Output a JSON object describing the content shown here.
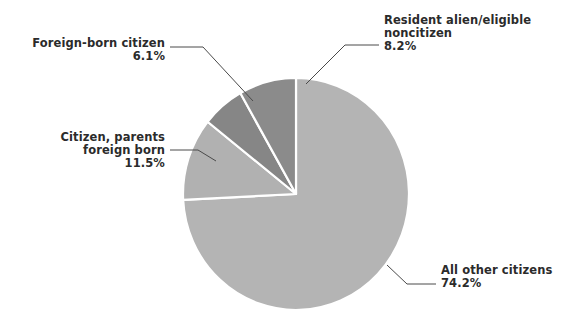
{
  "chart_data": {
    "type": "pie",
    "title": "",
    "categories": [
      "All other citizens",
      "Citizen, parents foreign born",
      "Foreign-born citizen",
      "Resident alien/eligible noncitizen"
    ],
    "values": [
      74.2,
      11.5,
      6.1,
      8.2
    ],
    "value_labels": [
      "74.2%",
      "11.5%",
      "6.1%",
      "8.2%"
    ],
    "unit": "%",
    "legend": "none",
    "grid": false,
    "start_angle_deg": 0,
    "direction": "clockwise",
    "colors": [
      "#b4b4b4",
      "#b1b1b1",
      "#868686",
      "#8b8b8b"
    ],
    "slice_separator_color": "#ffffff",
    "leader_line_color": "#4a4a4a",
    "background": "#ffffff",
    "text_color": "#2b2b2b"
  },
  "labels": {
    "resident_alien": {
      "line1": "Resident alien/eligible",
      "line2": "noncitizen",
      "value": "8.2%"
    },
    "foreign_born": {
      "line1": "Foreign-born citizen",
      "value": "6.1%"
    },
    "citizen_parents": {
      "line1": "Citizen, parents",
      "line2": "foreign born",
      "value": "11.5%"
    },
    "all_other": {
      "line1": "All other citizens",
      "value": "74.2%"
    }
  }
}
